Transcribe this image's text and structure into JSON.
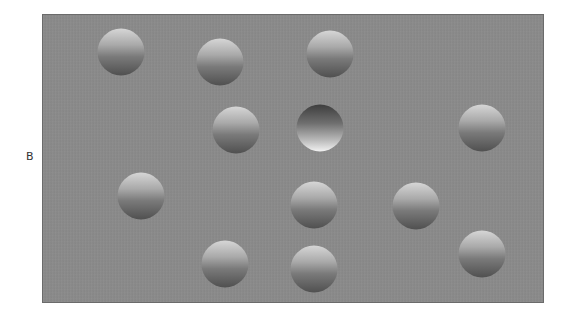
{
  "figure": {
    "panel_label": "B",
    "background_color": "#8a8a8a",
    "spheres": [
      {
        "id": 1,
        "x": 78,
        "y": 37,
        "type": "convex"
      },
      {
        "id": 2,
        "x": 177,
        "y": 47,
        "type": "convex"
      },
      {
        "id": 3,
        "x": 287,
        "y": 39,
        "type": "convex"
      },
      {
        "id": 4,
        "x": 193,
        "y": 115,
        "type": "convex"
      },
      {
        "id": 5,
        "x": 277,
        "y": 113,
        "type": "concave"
      },
      {
        "id": 6,
        "x": 439,
        "y": 113,
        "type": "convex"
      },
      {
        "id": 7,
        "x": 98,
        "y": 181,
        "type": "convex"
      },
      {
        "id": 8,
        "x": 271,
        "y": 190,
        "type": "convex"
      },
      {
        "id": 9,
        "x": 373,
        "y": 191,
        "type": "convex"
      },
      {
        "id": 10,
        "x": 182,
        "y": 249,
        "type": "convex"
      },
      {
        "id": 11,
        "x": 271,
        "y": 254,
        "type": "convex"
      },
      {
        "id": 12,
        "x": 439,
        "y": 239,
        "type": "convex"
      }
    ]
  }
}
